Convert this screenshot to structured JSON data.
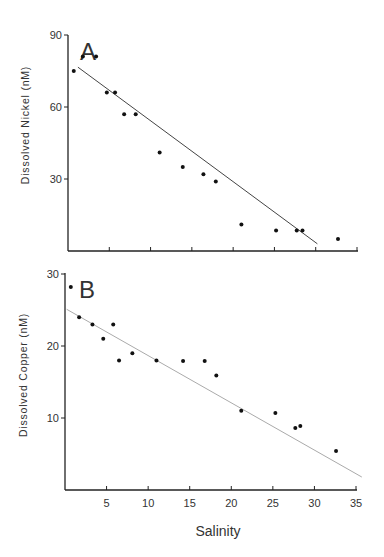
{
  "figure": {
    "x_axis_label": "Salinity",
    "x_tick_labels": [
      "5",
      "10",
      "15",
      "20",
      "25",
      "30",
      "35"
    ]
  },
  "chart_data": [
    {
      "type": "scatter",
      "panel": "A",
      "title": "A",
      "xlabel": "Salinity",
      "ylabel": "Dissolved Nickel (nM)",
      "xlim": [
        0,
        35
      ],
      "ylim": [
        0,
        90
      ],
      "x_ticks": [
        5,
        10,
        15,
        20,
        25,
        30,
        35
      ],
      "y_ticks": [
        30,
        60,
        90
      ],
      "y_tick_labels": [
        "30",
        "60",
        "90"
      ],
      "x_tick_labels_shown": false,
      "grid": false,
      "series": [
        {
          "name": "Dissolved Nickel",
          "points": [
            [
              0.7,
              75
            ],
            [
              1.8,
              81
            ],
            [
              3.4,
              81
            ],
            [
              4.7,
              66
            ],
            [
              5.7,
              66
            ],
            [
              6.8,
              57
            ],
            [
              8.2,
              57
            ],
            [
              11.1,
              41
            ],
            [
              13.9,
              35
            ],
            [
              16.4,
              32
            ],
            [
              17.9,
              29
            ],
            [
              21.0,
              11
            ],
            [
              25.2,
              8.5
            ],
            [
              27.7,
              8.5
            ],
            [
              28.4,
              8.5
            ],
            [
              32.7,
              5
            ]
          ]
        }
      ],
      "regression_line": {
        "x": [
          1.2,
          30.2
        ],
        "y": [
          76.6,
          3.0
        ],
        "color": "#444444"
      }
    },
    {
      "type": "scatter",
      "panel": "B",
      "title": "B",
      "xlabel": "Salinity",
      "ylabel": "Dissolved Copper (nM)",
      "xlim": [
        0,
        35
      ],
      "ylim": [
        0,
        30
      ],
      "x_ticks": [
        5,
        10,
        15,
        20,
        25,
        30,
        35
      ],
      "x_tick_labels": [
        "5",
        "10",
        "15",
        "20",
        "25",
        "30",
        "35"
      ],
      "y_ticks": [
        10,
        20,
        30
      ],
      "y_tick_labels": [
        "10",
        "20",
        "30"
      ],
      "grid": false,
      "series": [
        {
          "name": "Dissolved Copper",
          "points": [
            [
              0.7,
              28.2
            ],
            [
              1.7,
              24.0
            ],
            [
              3.3,
              23.0
            ],
            [
              4.6,
              21.0
            ],
            [
              5.8,
              23.0
            ],
            [
              6.5,
              18.0
            ],
            [
              8.1,
              19.0
            ],
            [
              11.0,
              18.0
            ],
            [
              14.2,
              17.9
            ],
            [
              16.8,
              17.9
            ],
            [
              18.2,
              15.9
            ],
            [
              21.2,
              11.0
            ],
            [
              25.3,
              10.7
            ],
            [
              27.7,
              8.6
            ],
            [
              28.3,
              8.9
            ],
            [
              32.6,
              5.4
            ]
          ]
        }
      ],
      "regression_line": {
        "x": [
          0.2,
          35.7
        ],
        "y": [
          25.1,
          1.8
        ],
        "color": "#aaaaaa"
      }
    }
  ],
  "layout": {
    "panels": [
      {
        "x0": 68,
        "x35": 357,
        "y_axis_bottom": 251,
        "y_px_per_unit": 2.4,
        "y_axis_top": 35,
        "letter_pos": [
          80,
          44
        ],
        "ylabel_center": [
          29,
          125
        ]
      },
      {
        "x0": 65,
        "x35": 356,
        "y_axis_bottom": 490,
        "y_px_per_unit": 7.2,
        "y_axis_top": 273,
        "letter_pos": [
          79,
          282
        ],
        "ylabel_center": [
          27,
          375
        ]
      }
    ],
    "xlabel_pos": [
      218,
      536
    ],
    "axis_color": "#222222",
    "dot_color": "#111111"
  }
}
